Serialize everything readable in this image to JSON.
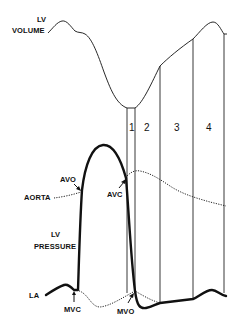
{
  "figure": {
    "labels": {
      "lv_volume_line1": "LV",
      "lv_volume_line2": "VOLUME",
      "lv_pressure_line1": "LV",
      "lv_pressure_line2": "PRESSURE",
      "aorta": "AORTA",
      "la": "LA",
      "avo": "AVO",
      "avc": "AVC",
      "mvc": "MVC",
      "mvo": "MVO"
    },
    "phases": [
      {
        "label": "1"
      },
      {
        "label": "2"
      },
      {
        "label": "3"
      },
      {
        "label": "4"
      }
    ],
    "colors": {
      "ink": "#111111",
      "background": "#ffffff"
    }
  }
}
